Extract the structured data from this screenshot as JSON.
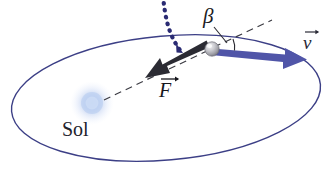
{
  "figure": {
    "width": 331,
    "height": 182,
    "background": "#ffffff"
  },
  "labels": {
    "sun": "Sol",
    "angle": "β",
    "force_vector": "F",
    "velocity_vector": "v"
  },
  "colors": {
    "orbit_stroke": "#3c3f86",
    "velocity_arrow": "#5055a8",
    "dotted_curve": "#2a2b73",
    "force_arrow": "#2b2b33",
    "dashed_line": "#3a3a42",
    "sun_glow": "#b9cdee",
    "particle_body": "#b9b9bd",
    "text": "#1a1a22"
  },
  "elements": {
    "orbit": {
      "name": "elliptical-orbit",
      "center_x": 166,
      "center_y": 98,
      "radius_x": 155,
      "radius_y": 62,
      "rotation_deg": -5,
      "stroke_width": 1.4
    },
    "sun": {
      "name": "sun-glow",
      "cx": 92,
      "cy": 103,
      "radius": 14
    },
    "particle": {
      "name": "orbiting-body",
      "cx": 212,
      "cy": 49,
      "radius": 7
    },
    "velocity_arrow": {
      "name": "velocity-vector",
      "x1": 212,
      "y1": 51,
      "x2": 306,
      "y2": 60,
      "width": 7
    },
    "force_arrow": {
      "name": "force-vector",
      "x1": 211,
      "y1": 50,
      "x2": 148,
      "y2": 78,
      "width": 8
    },
    "tangent_dashed": {
      "name": "tangent-reference-line",
      "x1": 214,
      "y1": 47,
      "x2": 272,
      "y2": 20
    },
    "radial_dashed": {
      "name": "sun-radius-dashed-line",
      "x1": 206,
      "y1": 52,
      "x2": 104,
      "y2": 100
    },
    "dotted_curve": {
      "name": "incoming-trajectory-dotted-curve",
      "start_x": 163,
      "start_y": 0,
      "end_x": 181,
      "end_y": 53
    },
    "angle_arc": {
      "name": "beta-angle-arc",
      "cx": 212,
      "cy": 49,
      "radius": 23
    },
    "beta_leader": {
      "name": "beta-leader-line",
      "x1": 213,
      "y1": 27,
      "x2": 220,
      "y2": 40
    }
  }
}
